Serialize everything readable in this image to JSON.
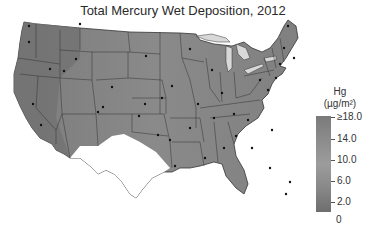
{
  "title": "Total Mercury Wet Deposition, 2012",
  "legend": {
    "title_line1": "Hg",
    "title_line2": "(µg/m²)",
    "units": "µg/m²",
    "ticks": [
      {
        "label": "≥18.0",
        "value": 18.0
      },
      {
        "label": "14.0",
        "value": 14.0
      },
      {
        "label": "10.0",
        "value": 10.0
      },
      {
        "label": "6.0",
        "value": 6.0
      },
      {
        "label": "2.0",
        "value": 2.0
      }
    ],
    "zero_label": "0",
    "colors": {
      "high": "#7a7a7a",
      "mid": "#9c9c9c",
      "low": "#6e6e6e"
    }
  },
  "map": {
    "region": "Contiguous United States",
    "no_data_color": "#ffffff",
    "lakes_color": "#d8d8d8",
    "border_color": "#333333",
    "fill_color": "#8a8a8a",
    "site_marker": "black-dot"
  }
}
